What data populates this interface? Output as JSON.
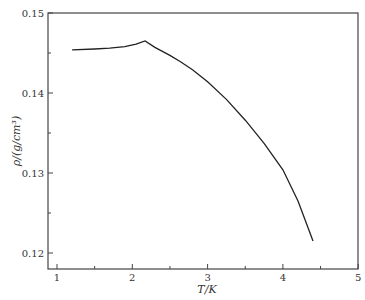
{
  "chart_data": {
    "type": "line",
    "title": "",
    "xlabel": "T/K",
    "ylabel": "ρ/(g/cm³)",
    "xlim": [
      0.9,
      5
    ],
    "ylim": [
      0.118,
      0.15
    ],
    "x_ticks": [
      "1",
      "2",
      "3",
      "4",
      "5"
    ],
    "y_ticks": [
      "0.12",
      "0.13",
      "0.14",
      "0.15"
    ],
    "grid": false,
    "legend": null,
    "series": [
      {
        "name": "density",
        "x": [
          1.2,
          1.5,
          1.7,
          1.9,
          2.05,
          2.17,
          2.3,
          2.5,
          2.64,
          2.8,
          3.0,
          3.25,
          3.5,
          3.75,
          4.0,
          4.2,
          4.4
        ],
        "y": [
          0.1454,
          0.1455,
          0.1456,
          0.1458,
          0.1461,
          0.1465,
          0.1457,
          0.1447,
          0.1439,
          0.1429,
          0.1414,
          0.1392,
          0.1366,
          0.1337,
          0.1304,
          0.1265,
          0.1215
        ]
      }
    ]
  }
}
